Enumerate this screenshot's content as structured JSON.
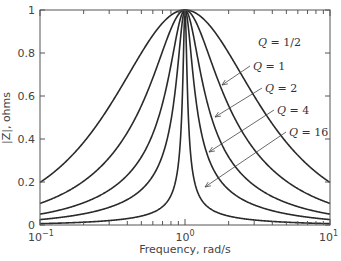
{
  "chart_data": {
    "type": "line",
    "title": "",
    "xlabel": "Frequency, rad/s",
    "ylabel": "|Z|, ohms",
    "xscale": "log",
    "xlim": [
      0.1,
      10
    ],
    "ylim": [
      0,
      1
    ],
    "x_ticks": [
      {
        "value": 0.1,
        "base": "10",
        "exp": "−1"
      },
      {
        "value": 1,
        "base": "10",
        "exp": "0"
      },
      {
        "value": 10,
        "base": "10",
        "exp": "1"
      }
    ],
    "y_ticks": [
      {
        "value": 0,
        "label": "0"
      },
      {
        "value": 0.2,
        "label": "0.2"
      },
      {
        "value": 0.4,
        "label": "0.4"
      },
      {
        "value": 0.6,
        "label": "0.6"
      },
      {
        "value": 0.8,
        "label": "0.8"
      },
      {
        "value": 1,
        "label": "1"
      }
    ],
    "grid": false,
    "legend": "inline annotations with arrows",
    "formula": "|Z| = 1 / sqrt(1 + Q^2 (w - 1/w)^2)",
    "series": [
      {
        "name": "Q = 1/2",
        "Q": 0.5,
        "x": [
          0.1,
          0.2,
          0.5,
          1,
          2,
          5,
          10
        ],
        "values": [
          0.2,
          0.39,
          0.8,
          1.0,
          0.8,
          0.39,
          0.2
        ]
      },
      {
        "name": "Q = 1",
        "Q": 1,
        "x": [
          0.1,
          0.2,
          0.5,
          1,
          2,
          5,
          10
        ],
        "values": [
          0.1,
          0.2,
          0.55,
          1.0,
          0.55,
          0.2,
          0.1
        ]
      },
      {
        "name": "Q = 2",
        "Q": 2,
        "x": [
          0.1,
          0.2,
          0.5,
          1,
          2,
          5,
          10
        ],
        "values": [
          0.05,
          0.1,
          0.32,
          1.0,
          0.32,
          0.1,
          0.05
        ]
      },
      {
        "name": "Q = 4",
        "Q": 4,
        "x": [
          0.1,
          0.2,
          0.5,
          1,
          2,
          5,
          10
        ],
        "values": [
          0.025,
          0.05,
          0.16,
          1.0,
          0.16,
          0.05,
          0.025
        ]
      },
      {
        "name": "Q = 16",
        "Q": 16,
        "x": [
          0.1,
          0.2,
          0.5,
          1,
          2,
          5,
          10
        ],
        "values": [
          0.006,
          0.013,
          0.04,
          1.0,
          0.04,
          0.013,
          0.006
        ]
      }
    ],
    "annotations": [
      {
        "text": "Q = 1/2",
        "q": "Q",
        "rest": " = 1/2",
        "label_x": 258,
        "label_y": 42,
        "arrow": null
      },
      {
        "text": "Q = 1",
        "q": "Q",
        "rest": " = 1",
        "label_x": 253,
        "label_y": 66,
        "arrow_from": [
          250,
          66
        ],
        "arrow_to": [
          222,
          85
        ]
      },
      {
        "text": "Q = 2",
        "q": "Q",
        "rest": " = 2",
        "label_x": 265,
        "label_y": 88,
        "arrow_from": [
          262,
          88
        ],
        "arrow_to": [
          215,
          117
        ]
      },
      {
        "text": "Q = 4",
        "q": "Q",
        "rest": " = 4",
        "label_x": 277,
        "label_y": 110,
        "arrow_from": [
          274,
          110
        ],
        "arrow_to": [
          209,
          152
        ]
      },
      {
        "text": "Q = 16",
        "q": "Q",
        "rest": " = 16",
        "label_x": 289,
        "label_y": 132,
        "arrow_from": [
          286,
          132
        ],
        "arrow_to": [
          205,
          187
        ]
      }
    ]
  }
}
